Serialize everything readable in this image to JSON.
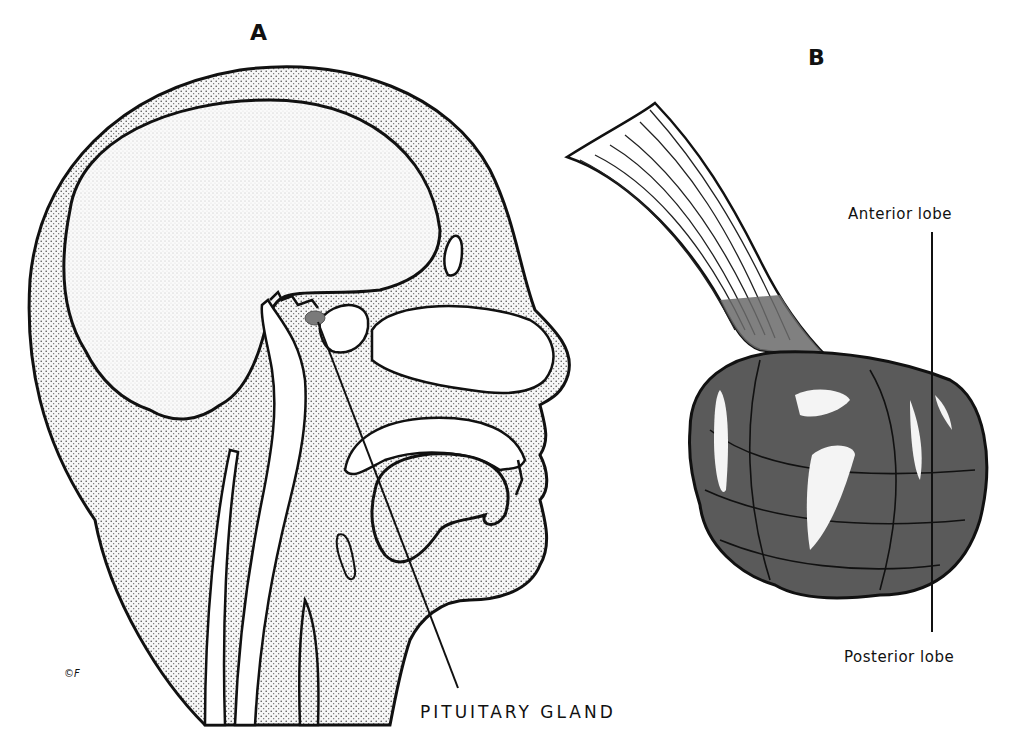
{
  "figure": {
    "panel_a": {
      "letter": "A",
      "subject": "sagittal section of human head",
      "callout": "PITUITARY GLAND",
      "signature": "©F"
    },
    "panel_b": {
      "letter": "B",
      "subject": "pituitary gland with stalk",
      "labels": {
        "anterior": "Anterior lobe",
        "posterior": "Posterior lobe"
      }
    },
    "colors": {
      "stipple": "#e6e6e6",
      "outline": "#111111",
      "gland_fill": "#5a5a5a",
      "gland_highlight": "#f4f4f4",
      "pituitary_spot": "#7a7a7a"
    }
  }
}
